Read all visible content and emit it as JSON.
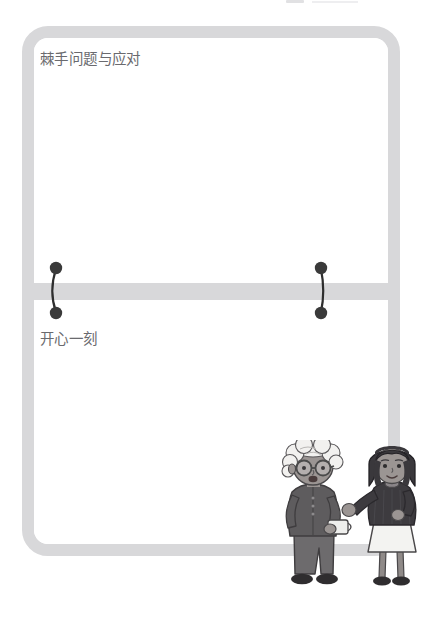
{
  "page": {
    "background_color": "#ffffff",
    "width": 430,
    "height": 619
  },
  "frame": {
    "border_color": "#d8d8da",
    "panel_color": "#ffffff",
    "corner_radius": "26px"
  },
  "sections": [
    {
      "id": "section-tricky-problems",
      "title": "棘手问题与应对",
      "body_text": "",
      "title_color": "#6a6a6e"
    },
    {
      "id": "section-happy-moment",
      "title": "开心一刻",
      "body_text": "",
      "title_color": "#6a6a6e"
    }
  ],
  "divider": {
    "color": "#d8d8da",
    "label": "panel-divider-bar"
  },
  "connectors": [
    {
      "id": "binder-ring-left",
      "dot_color": "#3a3a3a",
      "line_color": "#2e2e2e",
      "dot_count": 2
    },
    {
      "id": "binder-ring-right",
      "dot_color": "#3a3a3a",
      "line_color": "#2e2e2e",
      "dot_count": 2
    }
  ],
  "illustration": {
    "name": "two-women-conversation-illustration",
    "alt": "An elderly woman with white curly hair and round glasses holding a cup, talking with a younger woman with a dark bob haircut wearing a dark top and white skirt",
    "figures": [
      {
        "id": "elderly-woman",
        "hair": "white curly",
        "hair_color": "#f2f1ef",
        "glasses": true,
        "glasses_color": "#4a4a4a",
        "skin_color": "#9b9593",
        "top_color": "#5e5c5e",
        "pants_color": "#6d6b6d",
        "shoes_color": "#2f2d2f",
        "holding": "cup",
        "cup_color": "#efefed"
      },
      {
        "id": "young-woman",
        "hair": "dark bob",
        "hair_color": "#3a383c",
        "glasses": false,
        "skin_color": "#9b9593",
        "top_color": "#3d3b3f",
        "skirt_color": "#f3f3f1",
        "legs_color": "#8f8a88",
        "shoes_color": "#2f2d2f",
        "gesture": "open hand raised"
      }
    ]
  },
  "artifact": {
    "name": "top-edge-crop-remnant",
    "color": "#c9c9cc"
  }
}
